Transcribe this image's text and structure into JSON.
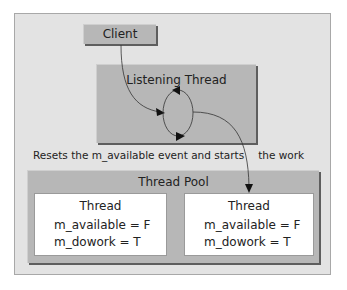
{
  "diagram": {
    "client": {
      "label": "Client"
    },
    "listening_thread": {
      "label": "Listening Thread"
    },
    "caption": {
      "text_before": "Resets the m_available event and starts",
      "text_after": "the work"
    },
    "thread_pool": {
      "label": "Thread Pool",
      "threads": [
        {
          "title": "Thread",
          "available": "m_available = F",
          "dowork": "m_dowork = T"
        },
        {
          "title": "Thread",
          "available": "m_available = F",
          "dowork": "m_dowork = T"
        }
      ]
    },
    "colors": {
      "panel_bg": "#e3e3e3",
      "box_fill": "#b7b7b7",
      "box_shadow": "#5e5e5e",
      "thread_fill": "#ffffff",
      "line": "#333333"
    }
  }
}
